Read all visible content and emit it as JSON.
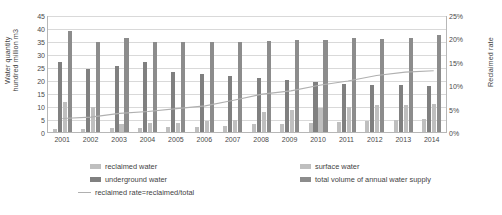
{
  "chart_data": {
    "type": "bar",
    "title": "",
    "subtitle": "",
    "xlabel": "",
    "ylabel": "Water quantity\nhundred million m3",
    "y2label": "Reclaimed rate",
    "grid": true,
    "legend_position": "bottom",
    "categories": [
      "2001",
      "2002",
      "2003",
      "2004",
      "2005",
      "2006",
      "2007",
      "2008",
      "2009",
      "2010",
      "2011",
      "2012",
      "2013",
      "2014"
    ],
    "ylim": [
      0,
      45
    ],
    "yticks": [
      0,
      5,
      10,
      15,
      20,
      25,
      30,
      35,
      40,
      45
    ],
    "ytick_labels": [
      "0",
      "5",
      "10",
      "15",
      "20",
      "25",
      "30",
      "35",
      "40",
      "45"
    ],
    "y2lim": [
      0,
      25
    ],
    "y2ticks": [
      0,
      5,
      10,
      15,
      20,
      25
    ],
    "y2tick_labels": [
      "0%",
      "5%",
      "10%",
      "15%",
      "20%",
      "25%"
    ],
    "series": [
      {
        "name": "reclaimed water",
        "type": "bar",
        "axis": "left",
        "color": "#bfbfbf",
        "values": [
          1.2,
          1.2,
          1.5,
          1.6,
          1.8,
          2.0,
          2.4,
          2.9,
          3.2,
          3.6,
          4.0,
          4.4,
          4.7,
          5.0
        ]
      },
      {
        "name": "underground water",
        "type": "bar",
        "axis": "left",
        "color": "#808080",
        "values": [
          27.0,
          24.2,
          25.5,
          26.8,
          23.2,
          22.3,
          21.7,
          20.8,
          20.0,
          19.2,
          18.6,
          18.2,
          18.0,
          17.8
        ]
      },
      {
        "name": "surface water",
        "type": "bar",
        "axis": "left",
        "color": "#bfbfbf",
        "values": [
          11.5,
          9.8,
          3.2,
          3.3,
          3.6,
          4.2,
          4.8,
          7.8,
          8.6,
          9.3,
          9.8,
          10.2,
          10.4,
          10.8
        ]
      },
      {
        "name": "total volume of annual water supply",
        "type": "bar",
        "axis": "left",
        "color": "#8c8c8c",
        "values": [
          39.0,
          34.5,
          36.0,
          34.8,
          34.7,
          34.6,
          34.6,
          35.1,
          35.5,
          35.2,
          36.0,
          35.8,
          36.2,
          37.5
        ]
      },
      {
        "name": "reclaimed rate=reclaimed/total",
        "type": "line",
        "axis": "right",
        "color": "#b0b0b0",
        "values": [
          3.1,
          3.4,
          4.2,
          4.6,
          5.2,
          5.8,
          7.0,
          8.3,
          9.0,
          10.2,
          11.1,
          12.3,
          13.0,
          13.3
        ]
      }
    ],
    "line_path_percent": [
      3.1,
      3.4,
      4.2,
      4.6,
      5.2,
      5.8,
      7.0,
      8.3,
      9.0,
      10.2,
      11.1,
      12.3,
      13.0,
      13.3
    ]
  },
  "legend": {
    "items": [
      {
        "label": "reclaimed water",
        "marker": "swatch",
        "color": "#bfbfbf"
      },
      {
        "label": "underground water",
        "marker": "swatch",
        "color": "#808080"
      },
      {
        "label": "surface water",
        "marker": "swatch",
        "color": "#bfbfbf"
      },
      {
        "label": "total volume of annual water supply",
        "marker": "swatch",
        "color": "#8c8c8c"
      },
      {
        "label": "reclaimed rate=reclaimed/total",
        "marker": "line",
        "color": "#b0b0b0"
      }
    ]
  }
}
